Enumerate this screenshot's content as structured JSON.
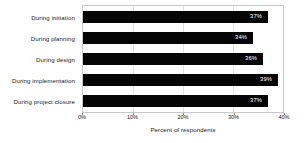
{
  "chart_data": {
    "type": "bar",
    "orientation": "horizontal",
    "title": "",
    "xlabel": "Percent of respondents",
    "ylabel": "",
    "categories": [
      "During initiation",
      "During planning",
      "During design",
      "During implementation",
      "During project closure"
    ],
    "values": [
      37,
      34,
      36,
      39,
      37
    ],
    "value_labels": [
      "37%",
      "34%",
      "36%",
      "39%",
      "37%"
    ],
    "xlim": [
      0,
      40
    ],
    "xticks": [
      0,
      10,
      20,
      30,
      40
    ],
    "xtick_labels": [
      "0%",
      "10%",
      "20%",
      "30%",
      "40%"
    ],
    "grid": true,
    "legend": false,
    "bar_color": "#050505",
    "value_label_color": "#ffffff",
    "plot_border_color": "#c8c8c8",
    "gridline_color": "#e2e2e2",
    "background_color": "#ffffff"
  }
}
